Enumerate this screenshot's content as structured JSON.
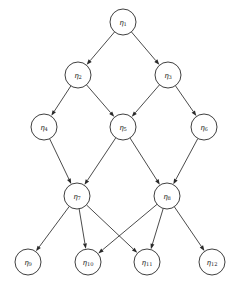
{
  "diagram": {
    "type": "directed-acyclic-graph",
    "background_color": "#ffffff",
    "node_fill_color": "#ffffff",
    "node_stroke_color": "#2a2a2a",
    "edge_color": "#2a2a2a",
    "node_radius": 13,
    "canvas": {
      "width": 248,
      "height": 285
    },
    "levels": [
      {
        "index": 0,
        "y": 22,
        "node_ids": [
          "n1"
        ]
      },
      {
        "index": 1,
        "y": 75,
        "node_ids": [
          "n2",
          "n3"
        ]
      },
      {
        "index": 2,
        "y": 127,
        "node_ids": [
          "n4",
          "n5",
          "n6"
        ]
      },
      {
        "index": 3,
        "y": 196,
        "node_ids": [
          "n7",
          "n8"
        ]
      },
      {
        "index": 4,
        "y": 262,
        "node_ids": [
          "n9",
          "n10",
          "n11",
          "n12"
        ]
      }
    ],
    "nodes": [
      {
        "id": "n1",
        "symbol": "η",
        "subscript": "1",
        "label": "η1",
        "x": 123,
        "y": 22
      },
      {
        "id": "n2",
        "symbol": "η",
        "subscript": "2",
        "label": "η2",
        "x": 78,
        "y": 75
      },
      {
        "id": "n3",
        "symbol": "η",
        "subscript": "3",
        "label": "η3",
        "x": 168,
        "y": 75
      },
      {
        "id": "n4",
        "symbol": "η",
        "subscript": "4",
        "label": "η4",
        "x": 44,
        "y": 127
      },
      {
        "id": "n5",
        "symbol": "η",
        "subscript": "5",
        "label": "η5",
        "x": 123,
        "y": 127
      },
      {
        "id": "n6",
        "symbol": "η",
        "subscript": "6",
        "label": "η6",
        "x": 204,
        "y": 127
      },
      {
        "id": "n7",
        "symbol": "η",
        "subscript": "7",
        "label": "η7",
        "x": 77,
        "y": 196
      },
      {
        "id": "n8",
        "symbol": "η",
        "subscript": "8",
        "label": "η8",
        "x": 167,
        "y": 196
      },
      {
        "id": "n9",
        "symbol": "η",
        "subscript": "9",
        "label": "η9",
        "x": 28,
        "y": 262
      },
      {
        "id": "n10",
        "symbol": "η",
        "subscript": "10",
        "label": "η10",
        "x": 88,
        "y": 262
      },
      {
        "id": "n11",
        "symbol": "η",
        "subscript": "11",
        "label": "η11",
        "x": 147,
        "y": 262
      },
      {
        "id": "n12",
        "symbol": "η",
        "subscript": "12",
        "label": "η12",
        "x": 212,
        "y": 262
      }
    ],
    "edges": [
      {
        "from": "n1",
        "to": "n2"
      },
      {
        "from": "n1",
        "to": "n3"
      },
      {
        "from": "n2",
        "to": "n4"
      },
      {
        "from": "n2",
        "to": "n5"
      },
      {
        "from": "n3",
        "to": "n5"
      },
      {
        "from": "n3",
        "to": "n6"
      },
      {
        "from": "n4",
        "to": "n7"
      },
      {
        "from": "n5",
        "to": "n7"
      },
      {
        "from": "n5",
        "to": "n8"
      },
      {
        "from": "n6",
        "to": "n8"
      },
      {
        "from": "n7",
        "to": "n9"
      },
      {
        "from": "n7",
        "to": "n10"
      },
      {
        "from": "n7",
        "to": "n11"
      },
      {
        "from": "n8",
        "to": "n10"
      },
      {
        "from": "n8",
        "to": "n11"
      },
      {
        "from": "n8",
        "to": "n12"
      }
    ]
  }
}
